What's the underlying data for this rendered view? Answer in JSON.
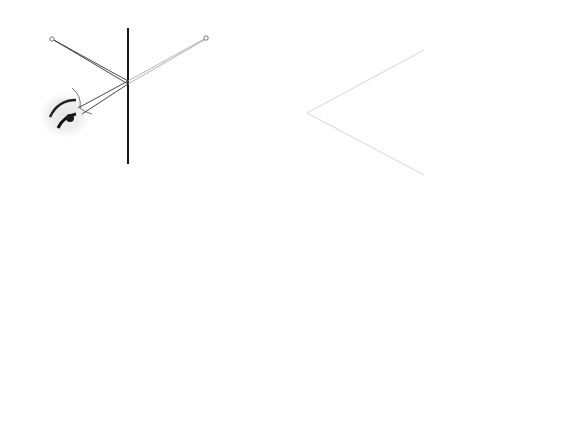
{
  "figures": [
    {
      "id": "23.13",
      "caption": {
        "marker": "▲",
        "label": "그림 23.13",
        "separator": "|",
        "title": "평면거울"
      },
      "labels": {
        "object": "O",
        "image": "I",
        "mirror": "거울"
      }
    },
    {
      "id": "23.14",
      "caption": {
        "marker": "▲",
        "label": "그림 23.14",
        "separator": "|",
        "title": "구면(오목)거울"
      },
      "labels": {
        "object": "O",
        "image": "I",
        "center": "C",
        "radius": "r"
      }
    },
    {
      "id": "23.15",
      "caption": {
        "marker": "▲",
        "label": "그림 23.15",
        "separator": "|",
        "title": "볼록거울"
      },
      "labels": {
        "object": "O",
        "image": "I"
      }
    }
  ]
}
